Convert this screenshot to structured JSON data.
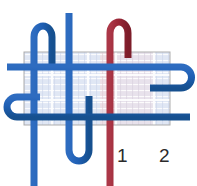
{
  "diagram": {
    "canvas": {
      "width": 197,
      "height": 186,
      "background": "#ffffff"
    },
    "colors": {
      "blue_thread": "#1f5fb4",
      "blue_thread_dark": "#17509e",
      "red_thread": "#9b2737",
      "red_thread_dark": "#84202e",
      "fabric_fill": "#dde4f2",
      "fabric_edge": "#a9a9a9",
      "fabric_tint_red": "#eed6dc",
      "label_text": "#2b2b2b"
    },
    "fabric": {
      "name": "fabric-swatch",
      "x": 24,
      "y": 52,
      "width": 146,
      "height": 73,
      "opacity": 0.72
    },
    "labels": [
      {
        "id": "label-1",
        "text": "1",
        "x": 121,
        "y": 157
      },
      {
        "id": "label-2",
        "text": "2",
        "x": 163,
        "y": 157
      }
    ],
    "threads": {
      "blue": [
        {
          "id": "blue-warp-left",
          "kind": "vertical",
          "x": 34,
          "top": 28,
          "bottom": 186
        },
        {
          "id": "blue-warp-center",
          "kind": "vertical",
          "x": 69,
          "top": 13,
          "bottom": 186
        },
        {
          "id": "blue-weft-upper",
          "kind": "horizontal",
          "y": 67,
          "left": 7,
          "right": 197
        },
        {
          "id": "blue-weft-lower",
          "kind": "horizontal",
          "y": 117,
          "left": 7,
          "right": 190
        },
        {
          "id": "blue-loop-top-left",
          "kind": "loop",
          "orientation": "up",
          "x1": 34,
          "x2": 52,
          "apex": 26
        },
        {
          "id": "blue-loop-bottom",
          "kind": "loop",
          "orientation": "down",
          "x1": 69,
          "x2": 89,
          "apex": 160
        },
        {
          "id": "blue-loop-left",
          "kind": "loop",
          "orientation": "left",
          "y1": 97,
          "y2": 117,
          "apex": 9
        },
        {
          "id": "blue-loop-right",
          "kind": "loop",
          "orientation": "right",
          "y1": 67,
          "y2": 88,
          "apex": 190
        }
      ],
      "red": [
        {
          "id": "red-warp-1",
          "kind": "vertical",
          "x": 110,
          "top": 40,
          "bottom": 186,
          "label": "1"
        },
        {
          "id": "red-warp-2",
          "kind": "vertical",
          "x": 152,
          "top": 125,
          "bottom": 186,
          "label": "2"
        },
        {
          "id": "red-loop-top",
          "kind": "loop",
          "orientation": "up",
          "x1": 110,
          "x2": 128,
          "apex": 22
        }
      ]
    },
    "grid": {
      "weft_rows": [
        57,
        68,
        80,
        92,
        104,
        116
      ],
      "warp_cols": [
        30,
        48,
        66,
        84,
        102,
        120,
        138,
        156
      ]
    }
  }
}
